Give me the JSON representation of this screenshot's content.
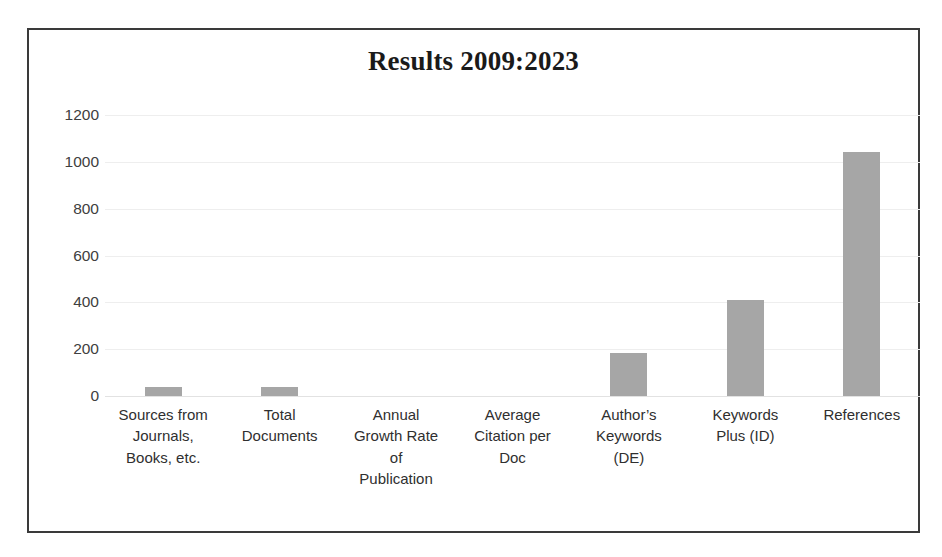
{
  "chart_data": {
    "type": "bar",
    "title": "Results 2009:2023",
    "xlabel": "",
    "ylabel": "",
    "ylim": [
      0,
      1200
    ],
    "ytick_labels": [
      "1200",
      "1000",
      "800",
      "600",
      "400",
      "200",
      "0"
    ],
    "ytick_values": [
      1200,
      1000,
      800,
      600,
      400,
      200,
      0
    ],
    "grid": true,
    "legend": false,
    "categories": [
      "Sources from Journals, Books, etc.",
      "Total Documents",
      "Annual Growth Rate of Publication",
      "Average Citation per Doc",
      "Author’s Keywords (DE)",
      "Keywords Plus (ID)",
      "References"
    ],
    "category_lines": [
      [
        "Sources from",
        "Journals,",
        "Books, etc."
      ],
      [
        "Total",
        "Documents"
      ],
      [
        "Annual",
        "Growth Rate",
        "of",
        "Publication"
      ],
      [
        "Average",
        "Citation per",
        "Doc"
      ],
      [
        "Author’s",
        "Keywords",
        "(DE)"
      ],
      [
        "Keywords",
        "Plus (ID)"
      ],
      [
        "References"
      ]
    ],
    "values": [
      40,
      40,
      0,
      0,
      183,
      408,
      1040
    ],
    "bar_color": "#a6a6a6"
  },
  "colors": {
    "bar": "#a6a6a6",
    "frame": "#3a3a3a",
    "gridline": "#eeeeee",
    "title_text": "#1a1a1a",
    "axis_text": "#404040"
  }
}
